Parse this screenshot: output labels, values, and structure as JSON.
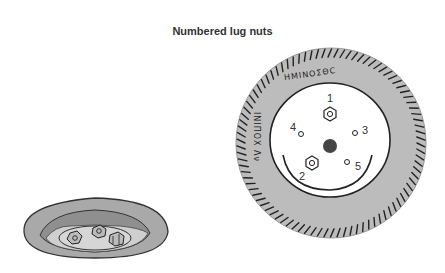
{
  "title": "Numbered lug nuts",
  "wheel": {
    "tire_text_top": "ΗΜΙΝΟΣΘC",
    "tire_text_left": "ΙΝΙΠΟΧ Λν",
    "lug_labels": [
      "1",
      "2",
      "3",
      "4",
      "5"
    ],
    "colors": {
      "tire": "#bcbcbc",
      "hub": "#ffffff",
      "center_hole": "#444444",
      "outline": "#222222"
    }
  },
  "bowl": {
    "description": "Bowl containing removed lug nuts",
    "nut_count": 3,
    "colors": {
      "bowl": "#a9a9a9",
      "inner": "#cfcfcf",
      "outline": "#333333"
    }
  }
}
